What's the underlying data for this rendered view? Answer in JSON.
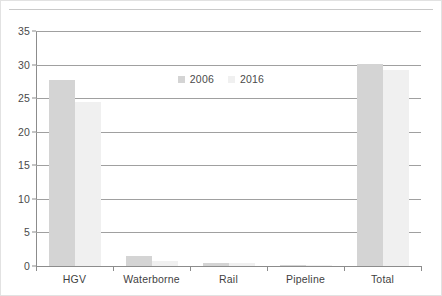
{
  "chart_data": {
    "type": "bar",
    "title": "",
    "subtitle": "",
    "xlabel": "",
    "ylabel": "",
    "categories": [
      "HGV",
      "Waterborne",
      "Rail",
      "Pipeline",
      "Total"
    ],
    "series": [
      {
        "name": "2006",
        "color": "#d4d4d4",
        "values": [
          27.7,
          1.5,
          0.5,
          0.1,
          30.1
        ]
      },
      {
        "name": "2016",
        "color": "#f0f0f0",
        "values": [
          24.5,
          0.8,
          0.4,
          0.1,
          29.2
        ]
      }
    ],
    "ylim": [
      0,
      35
    ],
    "yticks": [
      0,
      5,
      10,
      15,
      20,
      25,
      30,
      35
    ],
    "ytick_labels": [
      "0",
      "5",
      "10",
      "15",
      "20",
      "25",
      "30",
      "35"
    ],
    "grid": true,
    "legend_position": "top-center",
    "legend": [
      "2006",
      "2016"
    ]
  },
  "legend": {
    "entries": [
      {
        "label": "2006"
      },
      {
        "label": "2016"
      }
    ]
  },
  "axes": {
    "y_tick_labels": [
      "35",
      "30",
      "25",
      "20",
      "15",
      "10",
      "5",
      "0"
    ],
    "x_tick_labels": [
      "HGV",
      "Waterborne",
      "Rail",
      "Pipeline",
      "Total"
    ]
  }
}
